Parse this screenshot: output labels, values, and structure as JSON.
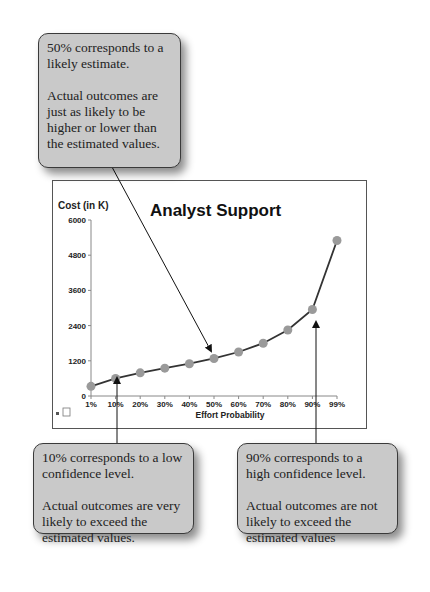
{
  "callouts": {
    "top": {
      "line1": "50% corresponds to a likely estimate.",
      "line2": "Actual outcomes are just as likely to be higher or lower than the estimated values."
    },
    "left": {
      "line1": "10% corresponds to a low confidence level.",
      "line2": "Actual outcomes are very likely to exceed the estimated values."
    },
    "right": {
      "line1": "90% corresponds to a high confidence level.",
      "line2": "Actual outcomes are not likely to exceed the estimated values"
    }
  },
  "colors": {
    "marker": "#9a9a9a",
    "line": "#333333",
    "callout_bg": "#c9c9c9"
  },
  "chart_data": {
    "type": "line",
    "title": "Analyst Support",
    "xlabel": "Effort Probability",
    "ylabel": "Cost (in K)",
    "categories": [
      "1%",
      "10%",
      "20%",
      "30%",
      "40%",
      "50%",
      "60%",
      "70%",
      "80%",
      "90%",
      "99%"
    ],
    "series": [
      {
        "name": "Cost",
        "values": [
          330,
          600,
          790,
          950,
          1100,
          1280,
          1500,
          1800,
          2250,
          2950,
          5300
        ]
      }
    ],
    "yticks": [
      0,
      1200,
      2400,
      3600,
      4800,
      6000
    ],
    "ytick_labels": [
      "0",
      "1200",
      "2400",
      "3600",
      "4800",
      "6000"
    ],
    "ylim": [
      0,
      6000
    ],
    "grid": false,
    "legend": "none"
  }
}
